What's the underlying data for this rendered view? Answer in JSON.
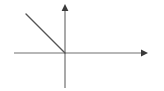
{
  "figure": {
    "name": "cartesian-axes-with-negative-slope-ray",
    "background_color": "#ffffff",
    "width": 164,
    "height": 91,
    "title": "",
    "caption": "",
    "labels": [],
    "tick_labels": [],
    "axis_color": "#707070",
    "ray_color": "#555555",
    "arrowhead_color": "#3a3a3a",
    "stroke_width": 1.2
  },
  "chart_data": {
    "type": "line",
    "title": "",
    "subtitle": "",
    "xlabel": "",
    "ylabel": "",
    "grid": false,
    "legend": null,
    "origin_px": {
      "x": 65,
      "y": 53
    },
    "axes": {
      "x_axis": {
        "name": "x-axis",
        "x1": 14,
        "y1": 53,
        "x2": 148,
        "y2": 53,
        "arrow_at": "positive-end",
        "color": "#707070"
      },
      "y_axis": {
        "name": "y-axis",
        "x1": 65,
        "y1": 88,
        "x2": 65,
        "y2": 4,
        "arrow_at": "positive-end",
        "color": "#707070"
      }
    },
    "series": [
      {
        "name": "ray",
        "description": "straight line segment of slope -1 in the second quadrant ending at the origin",
        "slope": -1,
        "points_px": [
          {
            "x": 26,
            "y": 14
          },
          {
            "x": 65,
            "y": 53
          }
        ],
        "color": "#555555"
      }
    ],
    "annotations": []
  }
}
